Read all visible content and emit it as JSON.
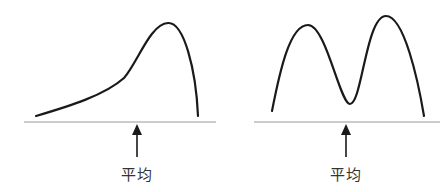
{
  "figures": [
    {
      "id": "left",
      "description": "Left-skewed single-peak distribution",
      "mean_label": "平均"
    },
    {
      "id": "right",
      "description": "Bimodal distribution",
      "mean_label": "平均"
    }
  ],
  "colors": {
    "curve": "#1a1a1a",
    "baseline": "#9a9a9a",
    "arrow": "#1a1a1a",
    "text": "#333333"
  }
}
